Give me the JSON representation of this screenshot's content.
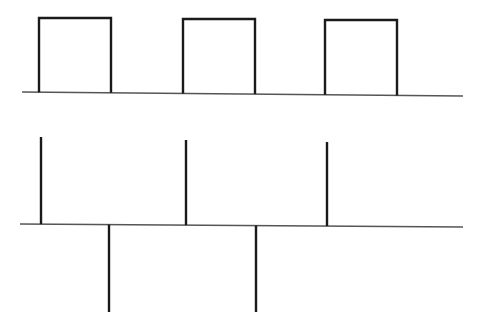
{
  "diagram": {
    "colors": {
      "stroke": "#1a1a1a",
      "axis": "#555555",
      "background": "#ffffff"
    },
    "pulse_train": {
      "baseline": {
        "x1": 22,
        "y1": 92,
        "x2": 463,
        "y2": 96
      },
      "pulses": [
        {
          "x_start": 39,
          "x_end": 111,
          "top": 18
        },
        {
          "x_start": 183,
          "x_end": 255,
          "top": 19
        },
        {
          "x_start": 325,
          "x_end": 397,
          "top": 20
        }
      ]
    },
    "impulse_train": {
      "baseline": {
        "x1": 20,
        "y1": 224,
        "x2": 463,
        "y2": 227
      },
      "positive_impulses": [
        {
          "x": 41,
          "top": 137
        },
        {
          "x": 186,
          "top": 140
        },
        {
          "x": 327,
          "top": 142
        }
      ],
      "negative_impulses": [
        {
          "x": 109,
          "bottom": 312
        },
        {
          "x": 256,
          "bottom": 312
        }
      ]
    }
  }
}
